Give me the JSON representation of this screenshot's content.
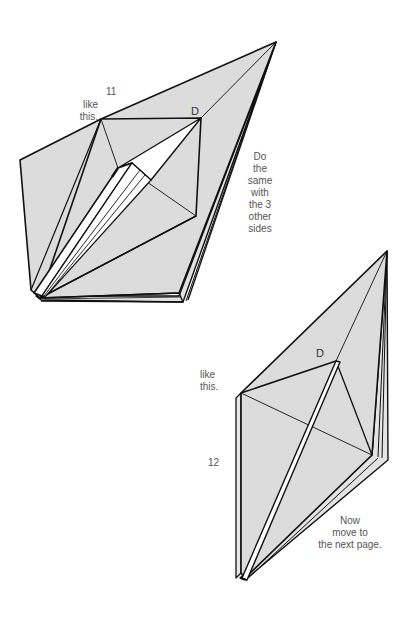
{
  "colors": {
    "paper": "#dcdcdc",
    "line": "#111111",
    "background": "#ffffff",
    "text": "#555555"
  },
  "figure11": {
    "step_number": "11",
    "caption_left": [
      "like",
      "this."
    ],
    "vertex_label": "D",
    "caption_right": [
      "Do",
      "the",
      "same",
      "with",
      "the 3",
      "other",
      "sides"
    ]
  },
  "figure12": {
    "step_number": "12",
    "caption_left": [
      "like",
      "this."
    ],
    "vertex_label": "D",
    "caption_bottom": [
      "Now",
      "move to",
      "the next page."
    ]
  }
}
